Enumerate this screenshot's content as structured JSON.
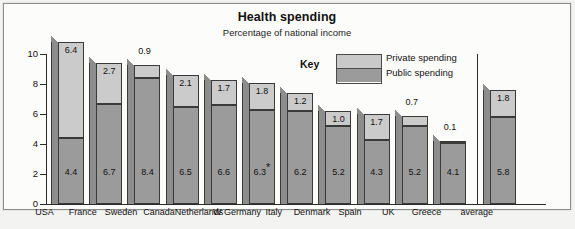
{
  "title": "Health spending",
  "subtitle": "Percentage of national income",
  "key": {
    "label": "Key",
    "private_label": "Private spending",
    "public_label": "Public spending",
    "private_color": "#cbcbcb",
    "public_color": "#9b9b9b"
  },
  "chart_data": {
    "type": "bar",
    "title": "Health spending",
    "subtitle": "Percentage of national income",
    "xlabel": "",
    "ylabel": "",
    "ylim": [
      0,
      11
    ],
    "yticks": [
      0,
      2,
      4,
      6,
      8,
      10
    ],
    "grid": false,
    "stacked": true,
    "legend_position": "top-right",
    "categories": [
      "USA",
      "France",
      "Sweden",
      "Canada",
      "Netherlands",
      "W Germany",
      "Italy",
      "Denmark",
      "Spain",
      "UK",
      "Greece",
      "average"
    ],
    "series": [
      {
        "name": "Public spending",
        "values": [
          4.4,
          6.7,
          8.4,
          6.5,
          6.6,
          6.3,
          6.2,
          5.2,
          4.3,
          5.2,
          4.1,
          5.8
        ]
      },
      {
        "name": "Private spending",
        "values": [
          6.4,
          2.7,
          0.9,
          2.1,
          1.7,
          1.8,
          1.2,
          1.0,
          1.7,
          0.7,
          0.1,
          1.8
        ]
      }
    ],
    "public_labels": [
      "4.4",
      "6.7",
      "8.4",
      "6.5",
      "6.6",
      "6.3",
      "6.2",
      "5.2",
      "4.3",
      "5.2",
      "4.1",
      "5.8"
    ],
    "private_labels": [
      "6.4",
      "2.7",
      "0.9",
      "2.1",
      "1.7",
      "1.8",
      "1.2",
      "1.0",
      "1.7",
      "0.7",
      "0.1",
      "1.8"
    ],
    "annotations": [
      {
        "category": "W Germany",
        "marker": "*",
        "on": "public_label"
      }
    ],
    "totals": [
      10.8,
      9.4,
      9.3,
      8.6,
      8.3,
      8.1,
      7.4,
      6.2,
      6.0,
      5.9,
      4.2,
      7.6
    ]
  },
  "axis": {
    "ticks": [
      "10",
      "8",
      "6",
      "4",
      "2",
      "0"
    ]
  }
}
